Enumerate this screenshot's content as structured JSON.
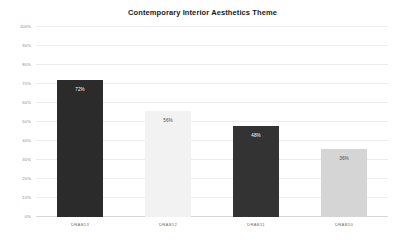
{
  "chart_data": {
    "type": "bar",
    "title": "Contemporary Interior Aesthetics Theme",
    "xlabel": "",
    "ylabel": "",
    "categories": [
      "DRAB13",
      "DRAB12",
      "DRAB11",
      "DRAB10"
    ],
    "values": [
      72,
      56,
      48,
      36
    ],
    "value_labels": [
      "72%",
      "56%",
      "48%",
      "36%"
    ],
    "bar_colors": [
      "#2b2b2b",
      "#f2f2f2",
      "#333333",
      "#d5d5d5"
    ],
    "value_label_colors": [
      "#ffffff",
      "#4a4a4a",
      "#ffffff",
      "#4a4a4a"
    ],
    "ylim": [
      0,
      100
    ],
    "yticks": [
      0,
      10,
      20,
      30,
      40,
      50,
      60,
      70,
      80,
      90,
      100
    ],
    "ytick_labels": [
      "0%",
      "10%",
      "20%",
      "30%",
      "40%",
      "50%",
      "60%",
      "70%",
      "80%",
      "90%",
      "100%"
    ],
    "grid": true,
    "legend": "none",
    "background": "#ffffff",
    "gridline_color": "#ededed"
  }
}
